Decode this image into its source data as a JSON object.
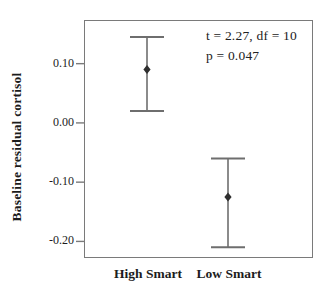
{
  "chart_data": {
    "type": "errorbar",
    "title": "",
    "xlabel": "",
    "ylabel": "Baseline residual cortisol",
    "categories": [
      "High Smart",
      "Low Smart"
    ],
    "series": [
      {
        "name": "mean",
        "values": [
          0.09,
          -0.125
        ]
      },
      {
        "name": "ci_low",
        "values": [
          0.02,
          -0.21
        ]
      },
      {
        "name": "ci_high",
        "values": [
          0.145,
          -0.06
        ]
      }
    ],
    "ytick_labels": [
      "0.10",
      "0.00",
      "-0.10",
      "-0.20"
    ],
    "ytick_values": [
      0.1,
      0.0,
      -0.1,
      -0.2
    ],
    "ylim": [
      -0.228,
      0.172
    ],
    "grid": false,
    "legend_position": "none",
    "annotation": {
      "line1": "t = 2.27, df = 10",
      "line2": "p = 0.047"
    }
  },
  "colors": {
    "frame": "#7a7a7a",
    "errorbar_line": "#6e6e6e",
    "cap_line": "#6e6e6e",
    "marker": "#2f2f2f",
    "text": "#1c1c1c",
    "background": "#ffffff"
  }
}
